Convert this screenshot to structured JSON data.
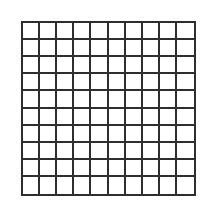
{
  "grid": {
    "rows": 10,
    "columns": 10,
    "line_color": "#2e2e2e",
    "cell_fill": "#ffffff",
    "background": "#ffffff"
  }
}
